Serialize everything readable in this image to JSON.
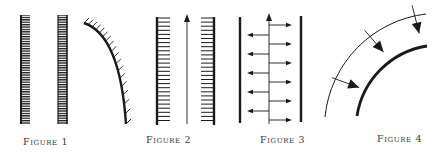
{
  "figures": [
    {
      "id": "fig1",
      "caption": "Figure 1",
      "description": "Two vertical hatched strips and a curved hatched wall"
    },
    {
      "id": "fig2",
      "caption": "Figure 2",
      "description": "Channel between two hatched walls with an upward flow arrow"
    },
    {
      "id": "fig3",
      "caption": "Figure 3",
      "description": "Two plain walls with central upward arrow and alternating horizontal arrows"
    },
    {
      "id": "fig4",
      "caption": "Figure 4",
      "description": "Concentric arcs with arrows pointing from outer thin arc to inner thick arc"
    }
  ],
  "colors": {
    "ink": "#1a1a1a",
    "caption": "#3a3a3a",
    "background": "#ffffff"
  }
}
